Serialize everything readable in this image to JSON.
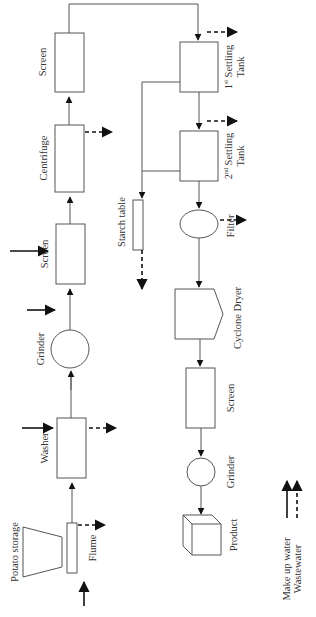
{
  "diagram": {
    "nodes": {
      "potato_storage": "Potato storage",
      "flume": "Flume",
      "washer": "Washer",
      "grinder_1": "Grinder",
      "screen_1": "Screen",
      "centrifuge": "Centrifuge",
      "screen_2": "Screen",
      "settling_tank_1": {
        "ordinal": "1",
        "suffix": "st",
        "name": "Settling",
        "line2": "Tank"
      },
      "settling_tank_2": {
        "ordinal": "2",
        "suffix": "nd",
        "name": "Settling",
        "line2": "Tank"
      },
      "starch_table": "Starch table",
      "filter": "Filter",
      "cyclone_dryer": "Cyclone Dryer",
      "screen_3": "Screen",
      "grinder_2": "Grinder",
      "product": "Product"
    },
    "legend": {
      "make_up_water": "Make up water",
      "wastewater": "Wastewater"
    },
    "colors": {
      "box_stroke": "#555555",
      "arrow": "#111111",
      "text": "#333333"
    }
  }
}
